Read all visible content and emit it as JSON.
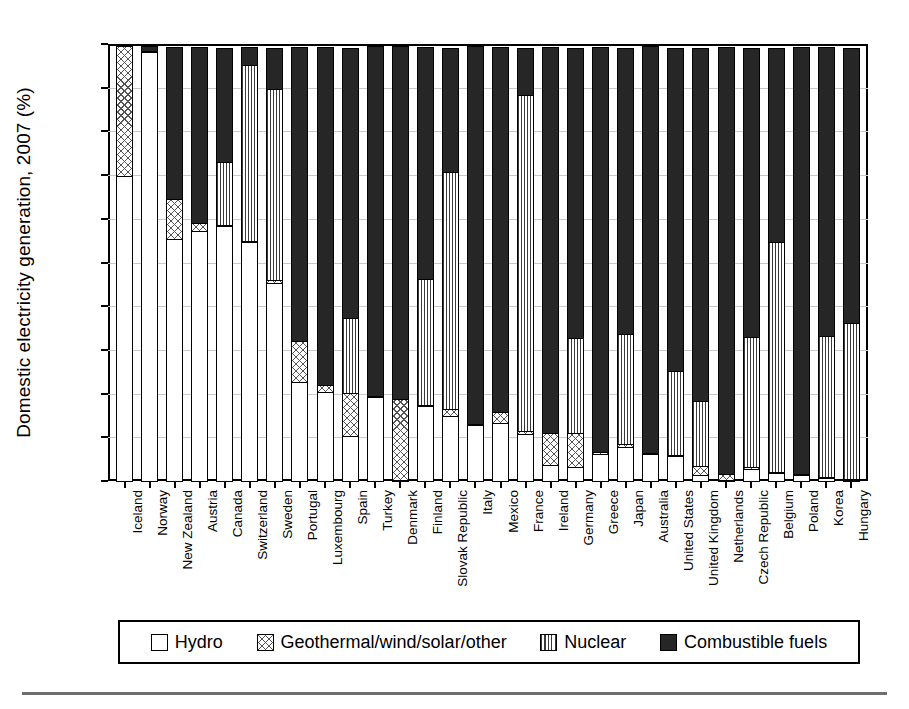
{
  "chart_data": {
    "type": "bar",
    "stacked": true,
    "title": "",
    "xlabel": "",
    "ylabel": "Domestic electricity generation, 2007 (%)",
    "ylim": [
      0,
      100
    ],
    "yticks": [
      0,
      10,
      20,
      30,
      40,
      50,
      60,
      70,
      80,
      90,
      100
    ],
    "grid": true,
    "legend_position": "bottom",
    "series": [
      {
        "name": "Hydro",
        "key": "hydro",
        "pattern": "white-open",
        "values": [
          70.0,
          98.5,
          55.5,
          57.5,
          58.5,
          55.0,
          45.5,
          23.0,
          20.5,
          10.5,
          19.5,
          0.2,
          17.5,
          15.0,
          13.0,
          13.5,
          11.0,
          4.0,
          3.5,
          6.5,
          8.0,
          6.5,
          6.0,
          1.5,
          0.5,
          3.0,
          2.0,
          1.5,
          1.0,
          0.5
        ]
      },
      {
        "name": "Geothermal/wind/solar/other",
        "key": "geo",
        "pattern": "crosshatch",
        "values": [
          30.0,
          0.3,
          9.5,
          2.0,
          0.6,
          0.3,
          1.0,
          9.5,
          2.0,
          10.0,
          0.3,
          18.8,
          0.3,
          2.0,
          0.3,
          2.8,
          1.0,
          7.5,
          8.0,
          0.5,
          0.9,
          0.3,
          0.4,
          2.5,
          1.5,
          0.6,
          0.4,
          0.4,
          0.3,
          0.4
        ]
      },
      {
        "name": "Nuclear",
        "key": "nuclear",
        "pattern": "vertical-lines",
        "values": [
          0.0,
          0.0,
          0.0,
          0.0,
          14.5,
          40.5,
          44.0,
          0.0,
          0.0,
          17.5,
          0.0,
          0.0,
          29.0,
          54.5,
          0.0,
          0.0,
          77.0,
          0.0,
          22.0,
          0.0,
          25.5,
          0.0,
          19.5,
          15.0,
          0.0,
          30.0,
          53.0,
          0.0,
          32.5,
          36.0
        ]
      },
      {
        "name": "Combustible fuels",
        "key": "fuels",
        "pattern": "solid-black",
        "values": [
          0.0,
          1.2,
          35.0,
          40.5,
          26.4,
          4.2,
          9.5,
          67.5,
          77.5,
          62.0,
          80.2,
          81.0,
          53.2,
          28.5,
          86.7,
          83.7,
          11.0,
          88.5,
          66.5,
          93.0,
          65.6,
          93.2,
          74.1,
          81.0,
          98.0,
          66.4,
          44.6,
          98.1,
          66.2,
          63.1
        ]
      }
    ],
    "categories": [
      "Iceland",
      "Norway",
      "New Zealand",
      "Austria",
      "Canada",
      "Switzerland",
      "Sweden",
      "Portugal",
      "Luxembourg",
      "Spain",
      "Turkey",
      "Denmark",
      "Finland",
      "Slovak Republic",
      "Italy",
      "Mexico",
      "France",
      "Ireland",
      "Germany",
      "Greece",
      "Japan",
      "Australia",
      "United States",
      "United Kingdom",
      "Netherlands",
      "Czech Republic",
      "Belgium",
      "Poland",
      "Korea",
      "Hungary"
    ]
  },
  "legend": {
    "items": [
      {
        "label": "Hydro",
        "key": "hydro"
      },
      {
        "label": "Geothermal/wind/solar/other",
        "key": "geo"
      },
      {
        "label": "Nuclear",
        "key": "nuclear"
      },
      {
        "label": "Combustible fuels",
        "key": "fuels"
      }
    ]
  }
}
